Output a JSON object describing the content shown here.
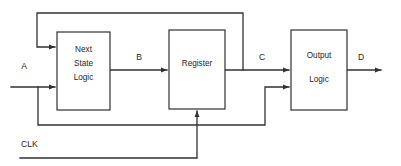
{
  "diagram": {
    "type": "block-diagram",
    "colors": {
      "background": "#ffffff",
      "line": "#303030",
      "text": "#262626",
      "block_fill": "#ffffff"
    },
    "blocks": [
      {
        "id": "next-state-logic",
        "lines": [
          "Next",
          "State",
          "Logic"
        ],
        "line1": "Next",
        "line2": "State",
        "line3": "Logic",
        "x": 57,
        "y": 32,
        "w": 53,
        "h": 78
      },
      {
        "id": "register",
        "lines": [
          "Register"
        ],
        "line1": "Register",
        "x": 169,
        "y": 30,
        "w": 56,
        "h": 79
      },
      {
        "id": "output-logic",
        "lines": [
          "Output",
          "Logic"
        ],
        "line1": "Output",
        "line2": "Logic",
        "x": 291,
        "y": 30,
        "w": 56,
        "h": 80
      }
    ],
    "signals": [
      {
        "id": "signal-a",
        "label": "A",
        "x": 24,
        "y": 67
      },
      {
        "id": "signal-b",
        "label": "B",
        "x": 139,
        "y": 58
      },
      {
        "id": "signal-c",
        "label": "C",
        "x": 262,
        "y": 58
      },
      {
        "id": "signal-d",
        "label": "D",
        "x": 361,
        "y": 58
      },
      {
        "id": "signal-clk",
        "label": "CLK",
        "x": 21,
        "y": 145
      }
    ],
    "wires": [
      {
        "id": "input-a-wire",
        "desc": "A input into Next State Logic"
      },
      {
        "id": "b-wire",
        "desc": "Next State Logic to Register"
      },
      {
        "id": "c-wire",
        "desc": "Register output C to Output Logic"
      },
      {
        "id": "d-wire",
        "desc": "Output Logic output D"
      },
      {
        "id": "state-feedback-wire",
        "desc": "C fed back to Next State Logic"
      },
      {
        "id": "a-branch-wire",
        "desc": "A branched to Output Logic second input"
      },
      {
        "id": "clk-wire",
        "desc": "CLK into Register"
      }
    ]
  }
}
